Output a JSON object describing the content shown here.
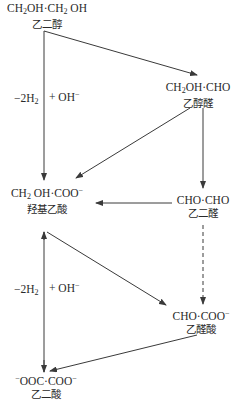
{
  "diagram": {
    "title": "",
    "nodes": [
      {
        "id": "ethylene_glycol",
        "formula_parts": [
          "CH",
          "2",
          "OH·CH",
          "2",
          " OH"
        ],
        "name": "乙二醇"
      },
      {
        "id": "glycolaldehyde",
        "formula_parts": [
          "CH",
          "2",
          "OH·CHO"
        ],
        "name": "乙醇醛"
      },
      {
        "id": "glycolate",
        "formula_parts": [
          "CH",
          "2",
          " OH·COO",
          "−"
        ],
        "name": "羟基乙酸"
      },
      {
        "id": "glyoxal",
        "formula": "CHO·CHO",
        "name": "乙二醛"
      },
      {
        "id": "glyoxylate",
        "formula_parts": [
          "CHO·COO",
          "−"
        ],
        "name": "乙醛酸"
      },
      {
        "id": "oxalate",
        "formula_parts": [
          "−",
          "OOC·COO",
          "−"
        ],
        "name": "乙二酸"
      }
    ],
    "edges": [
      {
        "from": "ethylene_glycol",
        "to": "glycolaldehyde",
        "style": "solid"
      },
      {
        "from": "ethylene_glycol",
        "to": "glycolate",
        "style": "solid"
      },
      {
        "from": "glycolaldehyde",
        "to": "glycolate",
        "style": "solid"
      },
      {
        "from": "glycolaldehyde",
        "to": "glyoxal",
        "style": "solid"
      },
      {
        "from": "glyoxal",
        "to": "glycolate",
        "style": "solid"
      },
      {
        "from": "glyoxal",
        "to": "glyoxylate",
        "style": "dashed"
      },
      {
        "from": "oxalate",
        "to": "glycolate",
        "style": "solid"
      },
      {
        "from": "glycolate",
        "to": "glyoxylate",
        "style": "solid"
      },
      {
        "from": "glyoxylate",
        "to": "oxalate",
        "style": "solid"
      }
    ],
    "edge_labels": {
      "upper_left": {
        "parts": [
          "−2H",
          "2"
        ]
      },
      "upper_right": {
        "parts": [
          "+ OH",
          "−"
        ]
      },
      "lower_left": {
        "parts": [
          "−2H",
          "2"
        ]
      },
      "lower_right": {
        "parts": [
          "+ OH",
          "−"
        ]
      }
    },
    "colors": {
      "line": "#3a3a3a",
      "text": "#2a2a2a",
      "background": "#ffffff"
    }
  }
}
